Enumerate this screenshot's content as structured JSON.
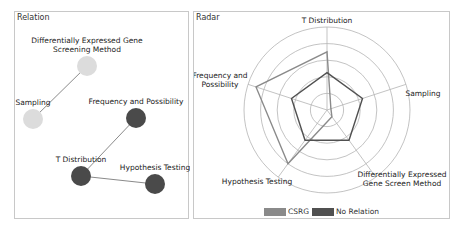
{
  "relation": {
    "title": "Relation",
    "nodes": [
      {
        "id": "dege",
        "label_lines": [
          "Differentially Expressed Gene",
          "Screening Method"
        ],
        "x": 72,
        "y": 54,
        "group": "CSRG",
        "color": "#dcdcdc"
      },
      {
        "id": "sampling",
        "label_lines": [
          "Sampling"
        ],
        "x": 18,
        "y": 107,
        "group": "CSRG",
        "color": "#dcdcdc"
      },
      {
        "id": "freq",
        "label_lines": [
          "Frequency and Possibility"
        ],
        "x": 121,
        "y": 106,
        "group": "No Relation",
        "color": "#4a4a4a"
      },
      {
        "id": "tdist",
        "label_lines": [
          "T Distribution"
        ],
        "x": 66,
        "y": 164,
        "group": "No Relation",
        "color": "#4a4a4a"
      },
      {
        "id": "hypo",
        "label_lines": [
          "Hypothesis Testing"
        ],
        "x": 140,
        "y": 172,
        "group": "No Relation",
        "color": "#4a4a4a"
      }
    ],
    "edges": [
      {
        "from": "dege",
        "to": "sampling"
      },
      {
        "from": "freq",
        "to": "tdist"
      },
      {
        "from": "tdist",
        "to": "hypo"
      }
    ]
  },
  "radar": {
    "title": "Radar"
  },
  "chart_data": [
    {
      "type": "network",
      "title": "Relation",
      "nodes": [
        "Differentially Expressed Gene Screening Method",
        "Sampling",
        "Frequency and Possibility",
        "T Distribution",
        "Hypothesis Testing"
      ],
      "groups": {
        "CSRG": [
          "Differentially Expressed Gene Screening Method",
          "Sampling"
        ],
        "No Relation": [
          "Frequency and Possibility",
          "T Distribution",
          "Hypothesis Testing"
        ]
      },
      "edges": [
        [
          "Differentially Expressed Gene Screening Method",
          "Sampling"
        ],
        [
          "Frequency and Possibility",
          "T Distribution"
        ],
        [
          "T Distribution",
          "Hypothesis Testing"
        ]
      ]
    },
    {
      "type": "radar",
      "title": "Radar",
      "categories": [
        "T Distribution",
        "Sampling",
        "Differentially Expressed Gene Screen Method",
        "Hypothesis Testing",
        "Frequency and Possibility"
      ],
      "category_label_lines": [
        [
          "T Distribution"
        ],
        [
          "Sampling"
        ],
        [
          "Differentially Expressed",
          "Gene Screen Method"
        ],
        [
          "Hypothesis Testing"
        ],
        [
          "Frequency and",
          "Possibility"
        ]
      ],
      "series": [
        {
          "name": "CSRG",
          "color": "#8a8a8a",
          "values": [
            0.7,
            0.05,
            0.1,
            0.8,
            0.9
          ]
        },
        {
          "name": "No Relation",
          "color": "#505050",
          "values": [
            0.45,
            0.45,
            0.45,
            0.45,
            0.45
          ]
        }
      ],
      "rings": 5,
      "range": [
        0,
        1
      ],
      "legend_position": "bottom",
      "grid": true
    }
  ]
}
